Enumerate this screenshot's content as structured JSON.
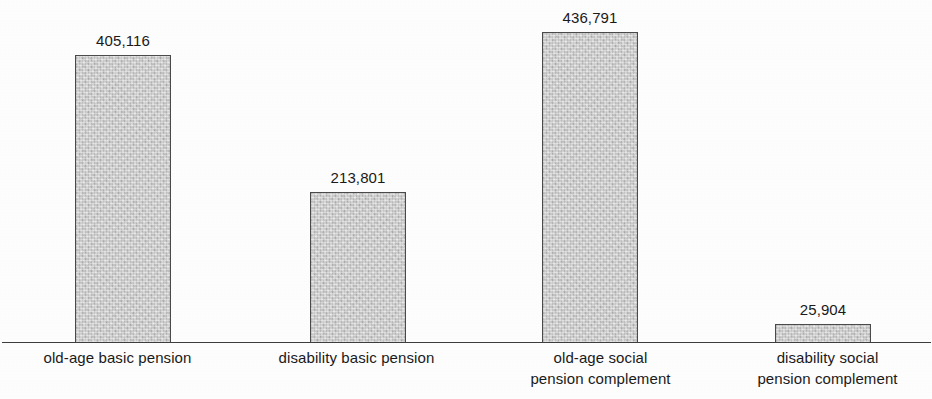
{
  "chart_data": {
    "type": "bar",
    "title": "",
    "subtitle": "",
    "xlabel": "",
    "ylabel": "",
    "grid": false,
    "legend": false,
    "axis_visible": {
      "x": true,
      "y": false
    },
    "ylim": [
      0,
      436791
    ],
    "categories": [
      "old-age basic pension",
      "disability basic pension",
      "old-age social pension complement",
      "disability social pension complement"
    ],
    "category_label_lines": [
      [
        "old-age basic pension"
      ],
      [
        "disability basic pension"
      ],
      [
        "old-age social",
        "pension complement"
      ],
      [
        "disability social",
        "pension complement"
      ]
    ],
    "values": [
      405116,
      213801,
      436791,
      25904
    ],
    "value_labels": [
      "405,116",
      "213,801",
      "436,791",
      "25,904"
    ],
    "colors": {
      "bar_fill": "#c2c2c2",
      "bar_border": "#4a4a4a",
      "axis": "#3d3d3d",
      "text": "#1a1a1a",
      "background": "#fdfdfd"
    }
  },
  "bars": [
    {
      "name": "old-age-basic-pension",
      "value_label": "405,116",
      "left": 75,
      "width": 96,
      "height": 288
    },
    {
      "name": "disability-basic-pension",
      "value_label": "213,801",
      "left": 310,
      "width": 96,
      "height": 151
    },
    {
      "name": "old-age-social-pension-complement",
      "value_label": "436,791",
      "left": 542,
      "width": 96,
      "height": 311
    },
    {
      "name": "disability-social-pension-complement",
      "value_label": "25,904",
      "left": 775,
      "width": 96,
      "height": 19
    }
  ],
  "category_label_boxes": [
    {
      "left": 0,
      "width": 235
    },
    {
      "left": 235,
      "width": 243
    },
    {
      "left": 478,
      "width": 245
    },
    {
      "left": 723,
      "width": 209
    }
  ]
}
